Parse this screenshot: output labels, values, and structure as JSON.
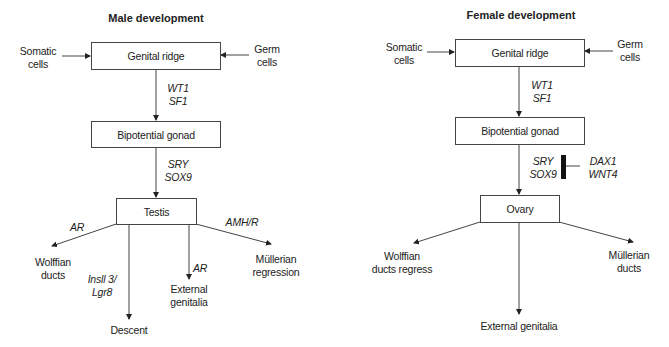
{
  "male": {
    "title": "Male development",
    "inputs": {
      "left": [
        "Somatic",
        "cells"
      ],
      "right": [
        "Germ",
        "cells"
      ]
    },
    "boxes": {
      "ridge": "Genital ridge",
      "bipotential": "Bipotential gonad",
      "gonad": "Testis"
    },
    "factors": {
      "ridge_to_bipotential": [
        "WT1",
        "SF1"
      ],
      "bipotential_to_gonad": [
        "SRY",
        "SOX9"
      ],
      "wolffian": "AR",
      "descent": [
        "Insll 3/",
        "Lgr8"
      ],
      "external": "AR",
      "mullerian": "AMH/R"
    },
    "outcomes": {
      "wolffian": [
        "Wolffian",
        "ducts"
      ],
      "descent": "Descent",
      "external": [
        "External",
        "genitalia"
      ],
      "mullerian": [
        "Müllerian",
        "regression"
      ]
    }
  },
  "female": {
    "title": "Female development",
    "inputs": {
      "left": [
        "Somatic",
        "cells"
      ],
      "right": [
        "Germ",
        "cells"
      ]
    },
    "boxes": {
      "ridge": "Genital ridge",
      "bipotential": "Bipotential gonad",
      "gonad": "Ovary"
    },
    "factors": {
      "ridge_to_bipotential": [
        "WT1",
        "SF1"
      ],
      "bipotential_to_gonad": [
        "SRY",
        "SOX9"
      ],
      "inhibitors": [
        "DAX1",
        "WNT4"
      ]
    },
    "outcomes": {
      "wolffian": [
        "Wolffian",
        "ducts regress"
      ],
      "external": "External genitalia",
      "mullerian": [
        "Müllerian",
        "ducts"
      ]
    }
  }
}
